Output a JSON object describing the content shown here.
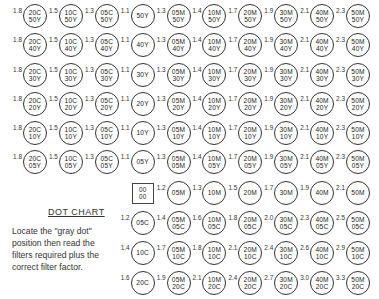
{
  "title": "DOT CHART",
  "description": "Locate the \"gray dot\" position then read the filters required plus the correct filter factor.",
  "gray_dot": {
    "top": "00",
    "bottom": "00"
  },
  "rows": [
    {
      "cells": [
        {
          "f": "1.8",
          "a": "20C",
          "b": "50Y"
        },
        {
          "f": "1.5",
          "a": "10C",
          "b": "50Y"
        },
        {
          "f": "1.3",
          "a": "05C",
          "b": "50Y"
        },
        {
          "f": "1.1",
          "a": "50Y",
          "b": ""
        },
        {
          "f": "1.3",
          "a": "05M",
          "b": "50Y"
        },
        {
          "f": "1.4",
          "a": "10M",
          "b": "50Y"
        },
        {
          "f": "1.7",
          "a": "20M",
          "b": "50Y"
        },
        {
          "f": "1.9",
          "a": "30M",
          "b": "50Y"
        },
        {
          "f": "2.1",
          "a": "40M",
          "b": "50Y"
        },
        {
          "f": "2.3",
          "a": "50M",
          "b": "50Y"
        }
      ]
    },
    {
      "cells": [
        {
          "f": "1.8",
          "a": "20C",
          "b": "40Y"
        },
        {
          "f": "1.5",
          "a": "10C",
          "b": "40Y"
        },
        {
          "f": "1.3",
          "a": "05C",
          "b": "40Y"
        },
        {
          "f": "1.1",
          "a": "40Y",
          "b": ""
        },
        {
          "f": "1.3",
          "a": "05M",
          "b": "40Y"
        },
        {
          "f": "1.4",
          "a": "10M",
          "b": "40Y"
        },
        {
          "f": "1.7",
          "a": "20M",
          "b": "40Y"
        },
        {
          "f": "1.9",
          "a": "30M",
          "b": "40Y"
        },
        {
          "f": "2.1",
          "a": "40M",
          "b": "40Y"
        },
        {
          "f": "2.3",
          "a": "50M",
          "b": "40Y"
        }
      ]
    },
    {
      "cells": [
        {
          "f": "1.8",
          "a": "20C",
          "b": "30Y"
        },
        {
          "f": "1.5",
          "a": "10C",
          "b": "30Y"
        },
        {
          "f": "1.3",
          "a": "05C",
          "b": "30Y"
        },
        {
          "f": "1.1",
          "a": "30Y",
          "b": ""
        },
        {
          "f": "1.3",
          "a": "05M",
          "b": "30Y"
        },
        {
          "f": "1.4",
          "a": "10M",
          "b": "30Y"
        },
        {
          "f": "1.7",
          "a": "20M",
          "b": "30Y"
        },
        {
          "f": "1.9",
          "a": "30M",
          "b": "30Y"
        },
        {
          "f": "2.1",
          "a": "40M",
          "b": "30Y"
        },
        {
          "f": "2.3",
          "a": "50M",
          "b": "30Y"
        }
      ]
    },
    {
      "cells": [
        {
          "f": "1.8",
          "a": "20C",
          "b": "20Y"
        },
        {
          "f": "1.5",
          "a": "10C",
          "b": "20Y"
        },
        {
          "f": "1.3",
          "a": "05C",
          "b": "20Y"
        },
        {
          "f": "1.1",
          "a": "20Y",
          "b": ""
        },
        {
          "f": "1.3",
          "a": "05M",
          "b": "20Y"
        },
        {
          "f": "1.4",
          "a": "10M",
          "b": "20Y"
        },
        {
          "f": "1.7",
          "a": "20M",
          "b": "20Y"
        },
        {
          "f": "1.9",
          "a": "30M",
          "b": "20Y"
        },
        {
          "f": "2.1",
          "a": "40M",
          "b": "20Y"
        },
        {
          "f": "2.3",
          "a": "50M",
          "b": "20Y"
        }
      ]
    },
    {
      "cells": [
        {
          "f": "1.8",
          "a": "20C",
          "b": "10Y"
        },
        {
          "f": "1.5",
          "a": "10C",
          "b": "10Y"
        },
        {
          "f": "1.3",
          "a": "05C",
          "b": "10Y"
        },
        {
          "f": "1.1",
          "a": "10Y",
          "b": ""
        },
        {
          "f": "1.3",
          "a": "05M",
          "b": "10Y"
        },
        {
          "f": "1.4",
          "a": "10M",
          "b": "10Y"
        },
        {
          "f": "1.7",
          "a": "20M",
          "b": "10Y"
        },
        {
          "f": "1.9",
          "a": "30M",
          "b": "10Y"
        },
        {
          "f": "2.1",
          "a": "40M",
          "b": "10Y"
        },
        {
          "f": "2.3",
          "a": "50M",
          "b": "10Y"
        }
      ]
    },
    {
      "cells": [
        {
          "f": "1.8",
          "a": "20C",
          "b": "05Y"
        },
        {
          "f": "1.5",
          "a": "10C",
          "b": "05Y"
        },
        {
          "f": "1.3",
          "a": "05C",
          "b": "05Y"
        },
        {
          "f": "1.1",
          "a": "05Y",
          "b": ""
        },
        {
          "f": "1.3",
          "a": "05M",
          "b": "05M"
        },
        {
          "f": "1.4",
          "a": "10M",
          "b": "05Y"
        },
        {
          "f": "1.7",
          "a": "20M",
          "b": "05Y"
        },
        {
          "f": "1.9",
          "a": "30M",
          "b": "05Y"
        },
        {
          "f": "2.1",
          "a": "40M",
          "b": "05Y"
        },
        {
          "f": "2.3",
          "a": "50M",
          "b": "05Y"
        }
      ]
    },
    {
      "cells": [
        null,
        null,
        null,
        "gray",
        {
          "f": "1.2",
          "a": "05M",
          "b": ""
        },
        {
          "f": "1.3",
          "a": "10M",
          "b": ""
        },
        {
          "f": "1.5",
          "a": "20M",
          "b": ""
        },
        {
          "f": "1.7",
          "a": "30M",
          "b": ""
        },
        {
          "f": "1.9",
          "a": "40M",
          "b": ""
        },
        {
          "f": "2.1",
          "a": "50M",
          "b": ""
        }
      ]
    },
    {
      "cells": [
        null,
        null,
        null,
        {
          "f": "1.2",
          "a": "05C",
          "b": ""
        },
        {
          "f": "1.4",
          "a": "05M",
          "b": "05C"
        },
        {
          "f": "1.6",
          "a": "10M",
          "b": "05C"
        },
        {
          "f": "1.8",
          "a": "20M",
          "b": "05C"
        },
        {
          "f": "2.0",
          "a": "30M",
          "b": "05C"
        },
        {
          "f": "2.3",
          "a": "40M",
          "b": "05C"
        },
        {
          "f": "2.5",
          "a": "50M",
          "b": "05C"
        }
      ]
    },
    {
      "cells": [
        null,
        null,
        null,
        {
          "f": "1.4",
          "a": "10C",
          "b": ""
        },
        {
          "f": "1.7",
          "a": "05M",
          "b": "10C"
        },
        {
          "f": "1.8",
          "a": "10M",
          "b": "10C"
        },
        {
          "f": "2.1",
          "a": "20M",
          "b": "10C"
        },
        {
          "f": "2.4",
          "a": "30M",
          "b": "10C"
        },
        {
          "f": "2.6",
          "a": "40M",
          "b": "10C"
        },
        {
          "f": "2.9",
          "a": "50M",
          "b": "10C"
        }
      ]
    },
    {
      "cells": [
        null,
        null,
        null,
        {
          "f": "1.6",
          "a": "20C",
          "b": ""
        },
        {
          "f": "1.9",
          "a": "05M",
          "b": "20C"
        },
        {
          "f": "2.1",
          "a": "10M",
          "b": "20C"
        },
        {
          "f": "2.4",
          "a": "20M",
          "b": "20C"
        },
        {
          "f": "2.7",
          "a": "30M",
          "b": "20C"
        },
        {
          "f": "3.0",
          "a": "40M",
          "b": "20C"
        },
        {
          "f": "3.3",
          "a": "50M",
          "b": "20C"
        }
      ]
    }
  ]
}
